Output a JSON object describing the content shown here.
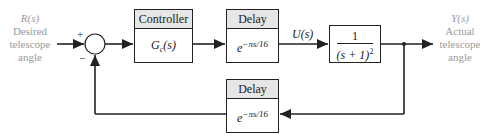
{
  "input": {
    "symbol": "R(s)",
    "line1": "Desired",
    "line2": "telescope",
    "line3": "angle"
  },
  "output": {
    "symbol": "Y(s)",
    "line1": "Actual",
    "line2": "telescope",
    "line3": "angle"
  },
  "summing_junction": {
    "plus": "+",
    "minus": "−"
  },
  "controller": {
    "header": "Controller",
    "g": "G",
    "sub": "c",
    "arg": "(s)"
  },
  "delay_forward": {
    "header": "Delay",
    "base": "e",
    "exponent": "−πs/16"
  },
  "delay_feedback": {
    "header": "Delay",
    "base": "e",
    "exponent": "−πs/16"
  },
  "plant": {
    "numerator": "1",
    "denominator": "(s + 1)",
    "power": "2"
  },
  "signals": {
    "u": "U(s)"
  },
  "colors": {
    "line": "#222222",
    "header_fill": "#e6e6e6",
    "label_gray": "#9a9a9a"
  }
}
